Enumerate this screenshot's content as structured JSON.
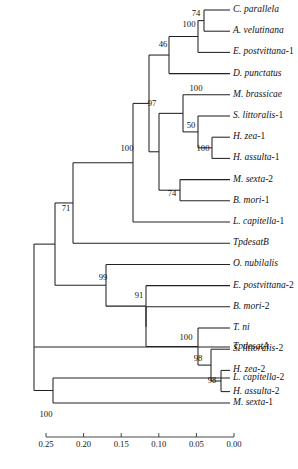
{
  "figure": {
    "type": "phylogenetic-tree",
    "title": "",
    "caption": "",
    "tip_count": 19,
    "scale": {
      "axis_label": "",
      "ticks": [
        "0.25",
        "0.20",
        "0.15",
        "0.10",
        "0.05",
        "0.00"
      ],
      "tick_values": [
        0.25,
        0.2,
        0.15,
        0.1,
        0.05,
        0.0
      ],
      "direction": "right-to-left",
      "px_per_unit": 752,
      "x_zero_px": 234,
      "y_px": 437
    },
    "tips": [
      {
        "id": "t0",
        "genus": "C. parallela",
        "suffix": "",
        "y": 10,
        "x": 224
      },
      {
        "id": "t1",
        "genus": "A. velutinana",
        "suffix": "",
        "y": 31.2,
        "x": 224
      },
      {
        "id": "t2",
        "genus": "E. postvittana",
        "suffix": "-1",
        "y": 52.4,
        "x": 224
      },
      {
        "id": "t3",
        "genus": "D. punctatus",
        "suffix": "",
        "y": 73.6,
        "x": 224
      },
      {
        "id": "t4",
        "genus": "M. brassicae",
        "suffix": "",
        "y": 94.8,
        "x": 224
      },
      {
        "id": "t5",
        "genus": "S. littoralis",
        "suffix": "-1",
        "y": 116.0,
        "x": 224
      },
      {
        "id": "t6",
        "genus": "H. zea",
        "suffix": "-1",
        "y": 137.2,
        "x": 224
      },
      {
        "id": "t7",
        "genus": "H. assulta",
        "suffix": "-1",
        "y": 158.4,
        "x": 224
      },
      {
        "id": "t8",
        "genus": "M. sexta",
        "suffix": "-2",
        "y": 179.6,
        "x": 224
      },
      {
        "id": "t9",
        "genus": "B. mori",
        "suffix": "-1",
        "y": 200.8,
        "x": 224
      },
      {
        "id": "t10",
        "genus": "L. capitella",
        "suffix": "-1",
        "y": 222.0,
        "x": 224
      },
      {
        "id": "t11",
        "genus": "TpdesatB",
        "suffix": "",
        "y": 243.2,
        "x": 224
      },
      {
        "id": "t12",
        "genus": "O. nubilalis",
        "suffix": "",
        "y": 264.4,
        "x": 224
      },
      {
        "id": "t13",
        "genus": "E. postvittana",
        "suffix": "-2",
        "y": 285.6,
        "x": 224
      },
      {
        "id": "t14",
        "genus": "B. mori",
        "suffix": "-2",
        "y": 306.8,
        "x": 224
      },
      {
        "id": "t15",
        "genus": "T. ni",
        "suffix": "",
        "y": 328.0,
        "x": 224
      },
      {
        "id": "t16",
        "genus": "S. littoralis",
        "suffix": "-2",
        "y": 349.2,
        "x": 224
      },
      {
        "id": "t17",
        "genus": "H. zea",
        "suffix": "-2",
        "y": 370.4,
        "x": 224
      },
      {
        "id": "t18",
        "genus": "H. assulta",
        "suffix": "-2",
        "y": 391.6,
        "x": 224
      },
      {
        "id": "t19",
        "genus": "TpdesatA",
        "suffix": "",
        "y": 391.6,
        "x": 224
      },
      {
        "id": "t20",
        "genus": "L. capitella",
        "suffix": "-2",
        "y": 391.6,
        "x": 224
      },
      {
        "id": "t21",
        "genus": "M. sexta",
        "suffix": "-1",
        "y": 391.6,
        "x": 224
      }
    ],
    "bootstrap_values": [
      {
        "label": "74",
        "x": 196,
        "y": 14,
        "node": "C.parallela+A.velutinana"
      },
      {
        "label": "100",
        "x": 189,
        "y": 25.5,
        "node": "cluster-tortricid-core"
      },
      {
        "label": "46",
        "x": 163,
        "y": 45,
        "node": "clade-tortricid-plus-dendrolimus"
      },
      {
        "label": "100",
        "x": 196,
        "y": 89,
        "node": "M.brassicae+S.littoralis-1"
      },
      {
        "label": "97",
        "x": 152,
        "y": 104,
        "node": "noctuid-plus-tortricid-clade"
      },
      {
        "label": "50",
        "x": 191,
        "y": 126,
        "node": "S.littoralis-1+Helicoverpa"
      },
      {
        "label": "100",
        "x": 203,
        "y": 149,
        "node": "H.zea-1+H.assulta-1"
      },
      {
        "label": "74",
        "x": 172,
        "y": 194,
        "node": "M.sexta-2+B.mori-1"
      },
      {
        "label": "100",
        "x": 127,
        "y": 149,
        "node": "desat-group1"
      },
      {
        "label": "71",
        "x": 66,
        "y": 209,
        "node": "group1-plus-TpdesatB"
      },
      {
        "label": "99",
        "x": 103,
        "y": 278,
        "node": "O.nubilalis-clade"
      },
      {
        "label": "91",
        "x": 139,
        "y": 296,
        "node": "E.postvittana-2-clade"
      },
      {
        "label": "100",
        "x": 186,
        "y": 338,
        "node": "T.ni-clade"
      },
      {
        "label": "98",
        "x": 198,
        "y": 359,
        "node": "S.littoralis-2-clade"
      },
      {
        "label": "98",
        "x": 212,
        "y": 381,
        "node": "H.zea-2+H.assulta-2"
      },
      {
        "label": "100",
        "x": 46,
        "y": 415,
        "node": "L.capitella-2+M.sexta-1"
      }
    ]
  }
}
